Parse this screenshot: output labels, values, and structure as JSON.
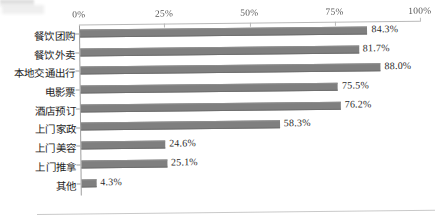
{
  "chart_data": {
    "type": "bar",
    "orientation": "horizontal",
    "title": "",
    "subtitle": "",
    "xlabel": "",
    "ylabel": "",
    "xlim": [
      0,
      100
    ],
    "grid": false,
    "legend": null,
    "legend_position": "none",
    "bar_color": "#7f7f7f",
    "axis_color": "#b9b9b9",
    "value_suffix": "%",
    "x_ticks": [
      {
        "value": 0,
        "label": "0%"
      },
      {
        "value": 25,
        "label": "25%"
      },
      {
        "value": 50,
        "label": "50%"
      },
      {
        "value": 75,
        "label": "75%"
      },
      {
        "value": 100,
        "label": "100%"
      }
    ],
    "categories": [
      "餐饮团购",
      "餐饮外卖",
      "本地交通出行",
      "电影票",
      "酒店预订",
      "上门家政",
      "上门美容",
      "上门推拿",
      "其他"
    ],
    "values": [
      84.3,
      81.7,
      88.0,
      75.5,
      76.2,
      58.3,
      24.6,
      25.1,
      4.3
    ],
    "value_labels": [
      "84.3%",
      "81.7%",
      "88.0%",
      "75.5%",
      "76.2%",
      "58.3%",
      "24.6%",
      "25.1%",
      "4.3%"
    ]
  }
}
